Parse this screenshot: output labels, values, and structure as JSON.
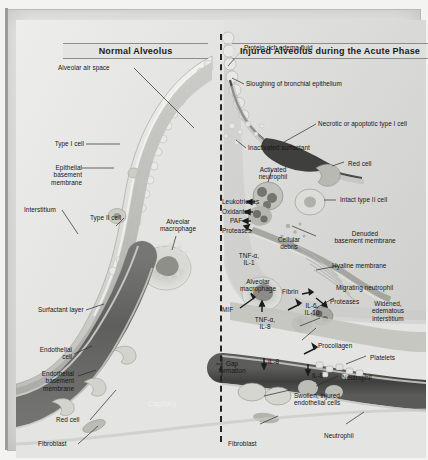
{
  "figure": {
    "title_left": "Normal Alveolus",
    "title_right": "Injured Alveolus during the Acute Phase",
    "colors": {
      "background": "#e6e6e4",
      "frame_border": "#b9b9b7",
      "capillary_lumen": "#585856",
      "red_cell": "#cfcfc9",
      "alveolar_space": "#dededc",
      "leader_line": "#2a2a2a",
      "divider": "#242424",
      "label_text": "#161616"
    }
  },
  "labels_left": [
    {
      "id": "alveolar-air-space",
      "text": "Alveolar air space"
    },
    {
      "id": "type-i-cell",
      "text": "Type I cell"
    },
    {
      "id": "epithelial-basement-membrane",
      "text": "Epithelial\nbasement\nmembrane"
    },
    {
      "id": "interstitium",
      "text": "Interstitium"
    },
    {
      "id": "type-ii-cell",
      "text": "Type II cell"
    },
    {
      "id": "alveolar-macrophage-left",
      "text": "Alveolar\nmacrophage"
    },
    {
      "id": "surfactant-layer",
      "text": "Surfactant layer"
    },
    {
      "id": "endothelial-cell",
      "text": "Endothelial\ncell"
    },
    {
      "id": "endothelial-basement-membrane",
      "text": "Endothelial\nbasement\nmembrane"
    },
    {
      "id": "red-cell-left",
      "text": "Red cell"
    },
    {
      "id": "fibroblast-left",
      "text": "Fibroblast"
    },
    {
      "id": "capillary",
      "text": "Capillary"
    }
  ],
  "labels_right": [
    {
      "id": "protein-rich-edema-fluid",
      "text": "Protein-rich edema fluid"
    },
    {
      "id": "sloughing-bronchial-epithelium",
      "text": "Sloughing of bronchial epithelium"
    },
    {
      "id": "necrotic-apoptotic-type-i-cell",
      "text": "Necrotic or apoptotic type I cell"
    },
    {
      "id": "inactivated-surfactant",
      "text": "Inactivated surfactant"
    },
    {
      "id": "activated-neutrophil",
      "text": "Activated\nneutrophil"
    },
    {
      "id": "leukotrienes",
      "text": "Leukotrienes"
    },
    {
      "id": "oxidants",
      "text": "Oxidants"
    },
    {
      "id": "paf",
      "text": "PAF"
    },
    {
      "id": "proteases-left",
      "text": "Proteases"
    },
    {
      "id": "cellular-debris",
      "text": "Cellular\ndebris"
    },
    {
      "id": "tnf-alpha-il-1",
      "text": "TNF-α,\nIL-1"
    },
    {
      "id": "alveolar-macrophage-right",
      "text": "Alveolar\nmacrophage"
    },
    {
      "id": "mif",
      "text": "MIF"
    },
    {
      "id": "tnf-alpha-il-8",
      "text": "TNF-α,\nIL-8"
    },
    {
      "id": "fibrin",
      "text": "Fibrin"
    },
    {
      "id": "il-6-il-10",
      "text": "IL-6,\nIL-10"
    },
    {
      "id": "procollagen",
      "text": "Procollagen"
    },
    {
      "id": "gap-formation",
      "text": "Gap\nformation"
    },
    {
      "id": "il-8-a",
      "text": "IL-8"
    },
    {
      "id": "il-8-b",
      "text": "IL-8"
    },
    {
      "id": "red-cell-right",
      "text": "Red cell"
    },
    {
      "id": "intact-type-ii-cell",
      "text": "Intact type II cell"
    },
    {
      "id": "denuded-basement-membrane",
      "text": "Denuded\nbasement membrane"
    },
    {
      "id": "hyaline-membrane",
      "text": "Hyaline membrane"
    },
    {
      "id": "migrating-neutrophil",
      "text": "Migrating neutrophil"
    },
    {
      "id": "proteases-right",
      "text": "Proteases"
    },
    {
      "id": "widened-edematous-interstitium",
      "text": "Widened,\nedematous\ninterstitium"
    },
    {
      "id": "platelets",
      "text": "Platelets"
    },
    {
      "id": "neutrophil-right",
      "text": "Neutrophil"
    },
    {
      "id": "swollen-injured-endothelial-cells",
      "text": "Swollen, injured\nendothelial cells"
    },
    {
      "id": "fibroblast-right",
      "text": "Fibroblast"
    },
    {
      "id": "neutrophil-bottom",
      "text": "Neutrophil"
    }
  ]
}
